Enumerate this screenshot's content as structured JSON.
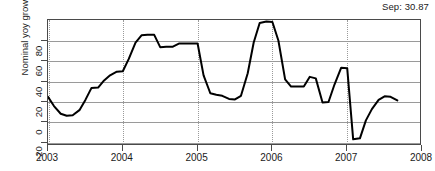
{
  "chart_data": {
    "type": "line",
    "title": "",
    "xlabel": "",
    "ylabel": "Nominal yoy growth (%)",
    "annotation": "Sep: 30.87",
    "grid": "horizontal solid, vertical dotted at year ticks",
    "legend": "none",
    "xlim": [
      2003.0,
      2008.0
    ],
    "ylim": [
      -23.0,
      100.0
    ],
    "yticks": [
      -20,
      0,
      20,
      40,
      60,
      80
    ],
    "ytick_labels": [
      "-20",
      "0",
      "20",
      "40",
      "60",
      "80"
    ],
    "xticks": [
      2003,
      2004,
      2005,
      2006,
      2007,
      2008
    ],
    "xtick_labels": [
      "2003",
      "2004",
      "2005",
      "2006",
      "2007",
      "2008"
    ],
    "line_color": "#000000",
    "line_width": 2.0,
    "series": [
      {
        "name": "Nominal yoy growth",
        "x": [
          2003.0,
          2003.08,
          2003.17,
          2003.25,
          2003.33,
          2003.42,
          2003.5,
          2003.58,
          2003.67,
          2003.75,
          2003.83,
          2003.92,
          2004.0,
          2004.08,
          2004.17,
          2004.25,
          2004.33,
          2004.42,
          2004.5,
          2004.58,
          2004.67,
          2004.75,
          2004.83,
          2004.92,
          2005.0,
          2005.08,
          2005.17,
          2005.25,
          2005.33,
          2005.42,
          2005.5,
          2005.58,
          2005.67,
          2005.75,
          2005.83,
          2005.92,
          2006.0,
          2006.08,
          2006.17,
          2006.25,
          2006.33,
          2006.42,
          2006.5,
          2006.58,
          2006.67,
          2006.75,
          2006.83,
          2006.92,
          2007.0,
          2007.08,
          2007.17,
          2007.25,
          2007.33,
          2007.42,
          2007.5,
          2007.58,
          2007.67
        ],
        "y": [
          25.0,
          16.0,
          8.5,
          6.5,
          7.0,
          12.0,
          22.0,
          33.5,
          34.0,
          41.0,
          46.0,
          49.5,
          50.0,
          62.0,
          78.0,
          85.0,
          85.5,
          85.5,
          73.5,
          74.0,
          74.0,
          77.0,
          77.0,
          77.0,
          77.0,
          46.0,
          28.5,
          27.0,
          26.0,
          23.0,
          22.5,
          26.0,
          48.0,
          78.0,
          97.0,
          98.5,
          98.0,
          80.0,
          42.0,
          35.0,
          35.0,
          35.0,
          44.5,
          43.0,
          19.5,
          20.0,
          37.0,
          53.5,
          53.0,
          -16.5,
          -15.5,
          2.0,
          13.0,
          22.0,
          25.5,
          25.0,
          21.5
        ]
      }
    ],
    "series_extra_note": "Line is monthly step-like series; last plotted value ends near 2007.67 at about 42."
  },
  "axis": {
    "ylabel_text": "Nominal yoy growth (%)"
  }
}
